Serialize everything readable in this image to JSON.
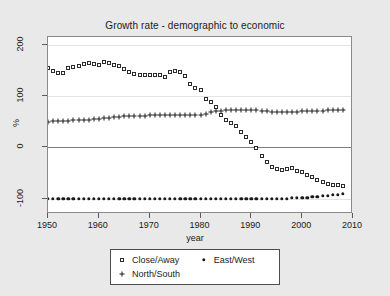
{
  "chart_data": {
    "type": "scatter",
    "title": "Growth rate - demographic to economic",
    "xlabel": "year",
    "ylabel": "%",
    "xlim": [
      1950,
      2010
    ],
    "ylim": [
      -130,
      215
    ],
    "xticks": [
      1950,
      1960,
      1970,
      1980,
      1990,
      2000,
      2010
    ],
    "yticks": [
      -100,
      0,
      100,
      200
    ],
    "grid": true,
    "legend_position": "below-center",
    "x": [
      1950,
      1951,
      1952,
      1953,
      1954,
      1955,
      1956,
      1957,
      1958,
      1959,
      1960,
      1961,
      1962,
      1963,
      1964,
      1965,
      1966,
      1967,
      1968,
      1969,
      1970,
      1971,
      1972,
      1973,
      1974,
      1975,
      1976,
      1977,
      1978,
      1979,
      1980,
      1981,
      1982,
      1983,
      1984,
      1985,
      1986,
      1987,
      1988,
      1989,
      1990,
      1991,
      1992,
      1993,
      1994,
      1995,
      1996,
      1997,
      1998,
      1999,
      2000,
      2001,
      2002,
      2003,
      2004,
      2005,
      2006,
      2007,
      2008
    ],
    "series": [
      {
        "name": "Close/Away",
        "marker": "open-square",
        "values": [
          155,
          148,
          144,
          145,
          154,
          156,
          158,
          162,
          165,
          163,
          160,
          166,
          164,
          160,
          158,
          152,
          146,
          143,
          142,
          142,
          141,
          141,
          142,
          138,
          146,
          149,
          147,
          140,
          124,
          115,
          111,
          94,
          88,
          78,
          63,
          53,
          48,
          41,
          30,
          21,
          10,
          -1,
          -16,
          -29,
          -38,
          -43,
          -44,
          -43,
          -41,
          -46,
          -49,
          -53,
          -57,
          -63,
          -68,
          -71,
          -74,
          -74,
          -75
        ]
      },
      {
        "name": "East/West",
        "marker": "filled-circle",
        "values": [
          -101,
          -101,
          -101,
          -101,
          -101,
          -101,
          -101,
          -101,
          -101,
          -101,
          -101,
          -101,
          -101,
          -101,
          -101,
          -101,
          -101,
          -101,
          -101,
          -101,
          -101,
          -101,
          -101,
          -101,
          -101,
          -101,
          -101,
          -101,
          -101,
          -101,
          -101,
          -101,
          -101,
          -101,
          -101,
          -101,
          -101,
          -101,
          -101,
          -101,
          -101,
          -101,
          -101,
          -101,
          -101,
          -100,
          -100,
          -100,
          -99,
          -99,
          -98,
          -98,
          -97,
          -96,
          -95,
          -94,
          -93,
          -92,
          -90
        ]
      },
      {
        "name": "North/South",
        "marker": "plus",
        "values": [
          50,
          51,
          51,
          52,
          52,
          53,
          53,
          54,
          54,
          55,
          56,
          57,
          58,
          59,
          60,
          61,
          62,
          62,
          62,
          62,
          63,
          63,
          63,
          63,
          63,
          63,
          63,
          63,
          63,
          64,
          64,
          65,
          68,
          70,
          71,
          72,
          72,
          73,
          73,
          73,
          72,
          72,
          71,
          70,
          69,
          68,
          68,
          68,
          68,
          69,
          70,
          70,
          71,
          71,
          71,
          72,
          72,
          72,
          72
        ]
      }
    ]
  },
  "legend": {
    "items": [
      {
        "label": "Close/Away",
        "marker": "open-square"
      },
      {
        "label": "East/West",
        "marker": "filled-circle"
      },
      {
        "label": "North/South",
        "marker": "plus"
      }
    ]
  },
  "colors": {
    "background": "#e9e9e9",
    "plot_background": "#ffffff",
    "frame": "#8a8a8a",
    "gridline": "#e4e4e4",
    "zeroline": "#7d7d7d",
    "marker": "#1a1a1a"
  }
}
